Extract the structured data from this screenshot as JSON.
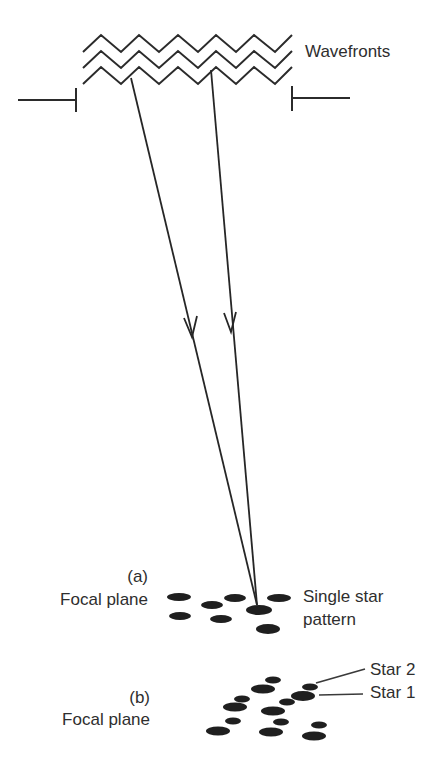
{
  "diagram": {
    "title": "",
    "labels": {
      "wavefronts": "Wavefronts",
      "panel_a": "(a)",
      "focal_plane_a": "Focal plane",
      "single_star_line1": "Single star",
      "single_star_line2": "pattern",
      "panel_b": "(b)",
      "focal_plane_b": "Focal plane",
      "star2": "Star 2",
      "star1": "Star 1"
    },
    "colors": {
      "ink": "#2b2b2b",
      "spot": "#1f1f1f",
      "text": "#2e2e2e",
      "background": "#ffffff"
    },
    "wavefronts": {
      "count": 3,
      "x_start": 83,
      "x_end": 292,
      "y_offsets": [
        0,
        16,
        32
      ],
      "peak_y": 35,
      "valley_y": 52
    },
    "aperture_stops": [
      {
        "side": "left",
        "line": [
          18,
          100,
          76,
          100
        ],
        "tick": [
          76,
          88,
          76,
          112
        ]
      },
      {
        "side": "right",
        "line": [
          292,
          98,
          350,
          98
        ],
        "tick": [
          292,
          86,
          292,
          111
        ]
      }
    ],
    "rays": [
      {
        "from": [
          131,
          78
        ],
        "to": [
          257,
          605
        ],
        "arrow_at": [
          192,
          337
        ]
      },
      {
        "from": [
          211,
          70
        ],
        "to": [
          257,
          605
        ],
        "arrow_at": [
          231,
          332
        ]
      }
    ],
    "spots_a": [
      {
        "cx": 179,
        "cy": 597,
        "rx": 12,
        "ry": 4
      },
      {
        "cx": 212,
        "cy": 605,
        "rx": 11,
        "ry": 4
      },
      {
        "cx": 235,
        "cy": 598,
        "rx": 11,
        "ry": 4
      },
      {
        "cx": 279,
        "cy": 598,
        "rx": 12,
        "ry": 4
      },
      {
        "cx": 180,
        "cy": 616,
        "rx": 11,
        "ry": 4
      },
      {
        "cx": 221,
        "cy": 619,
        "rx": 11,
        "ry": 4
      },
      {
        "cx": 259,
        "cy": 610,
        "rx": 13,
        "ry": 5
      },
      {
        "cx": 268,
        "cy": 629,
        "rx": 12,
        "ry": 5
      }
    ],
    "spots_b": [
      {
        "cx": 273,
        "cy": 680,
        "rx": 8,
        "ry": 3.5
      },
      {
        "cx": 263,
        "cy": 689,
        "rx": 12,
        "ry": 4.5
      },
      {
        "cx": 310,
        "cy": 687,
        "rx": 8,
        "ry": 3.5
      },
      {
        "cx": 303,
        "cy": 696,
        "rx": 12,
        "ry": 5
      },
      {
        "cx": 242,
        "cy": 699,
        "rx": 8,
        "ry": 3.5
      },
      {
        "cx": 287,
        "cy": 702,
        "rx": 8,
        "ry": 3.5
      },
      {
        "cx": 235,
        "cy": 707,
        "rx": 12,
        "ry": 4.5
      },
      {
        "cx": 273,
        "cy": 711,
        "rx": 12,
        "ry": 4.5
      },
      {
        "cx": 233,
        "cy": 721,
        "rx": 8,
        "ry": 3.5
      },
      {
        "cx": 281,
        "cy": 722,
        "rx": 8,
        "ry": 3.5
      },
      {
        "cx": 319,
        "cy": 725,
        "rx": 8,
        "ry": 3.5
      },
      {
        "cx": 218,
        "cy": 731,
        "rx": 12,
        "ry": 4.5
      },
      {
        "cx": 271,
        "cy": 732,
        "rx": 12,
        "ry": 4.5
      },
      {
        "cx": 314,
        "cy": 736,
        "rx": 12,
        "ry": 4.5
      }
    ],
    "leaders": [
      {
        "label": "star2",
        "line": [
          316,
          683,
          365,
          669
        ]
      },
      {
        "label": "star1",
        "line": [
          319,
          695,
          363,
          694
        ]
      }
    ]
  }
}
